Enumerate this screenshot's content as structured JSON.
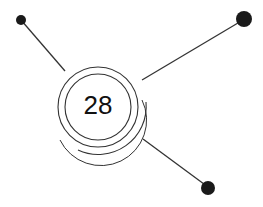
{
  "diagram": {
    "center_label": "28",
    "colors": {
      "stroke": "#333333",
      "node": "#1a1a1a",
      "background": "#ffffff"
    },
    "connectors": [
      {
        "name": "top-left",
        "node_size": "small"
      },
      {
        "name": "top-right",
        "node_size": "large"
      },
      {
        "name": "bottom-right",
        "node_size": "medium"
      }
    ]
  }
}
